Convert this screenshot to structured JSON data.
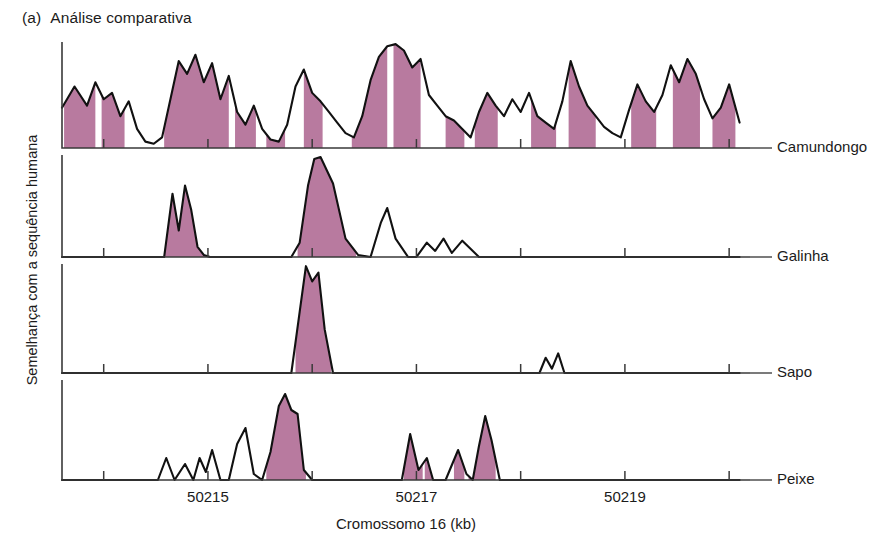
{
  "figure": {
    "tag": "(a)",
    "title": "Análise comparativa",
    "y_axis_label": "Semelhança com a sequência humana",
    "x_axis_label": "Cromossomo 16 (kb)"
  },
  "chart_data": {
    "type": "area",
    "title": "Análise comparativa",
    "xlabel": "Cromossomo 16 (kb)",
    "ylabel": "Semelhança com a sequência humana",
    "xlim": [
      50213.6,
      50220.2
    ],
    "ylim": [
      0,
      100
    ],
    "grid": false,
    "legend_position": "right-of-each-panel",
    "xticks": [
      50214,
      50215,
      50216,
      50217,
      50218,
      50219,
      50220
    ],
    "xtick_labels": [
      "",
      "50215",
      "",
      "50217",
      "",
      "50219",
      ""
    ],
    "fill_color": "#b87a9f",
    "line_color": "#111111",
    "fill_rule": "regions above conservation threshold are shaded",
    "panels": [
      {
        "name": "Camundongo",
        "order": 1,
        "description": "Conservação alta e contínua ao longo de toda a região, com numerosos picos amplos sombreados.",
        "x": [
          50213.6,
          50213.72,
          50213.84,
          50213.92,
          50214.0,
          50214.08,
          50214.16,
          50214.24,
          50214.32,
          50214.4,
          50214.48,
          50214.56,
          50214.64,
          50214.72,
          50214.8,
          50214.88,
          50214.96,
          50215.04,
          50215.12,
          50215.2,
          50215.28,
          50215.36,
          50215.44,
          50215.52,
          50215.6,
          50215.68,
          50215.76,
          50215.84,
          50215.92,
          50216.0,
          50216.08,
          50216.16,
          50216.24,
          50216.32,
          50216.4,
          50216.48,
          50216.56,
          50216.64,
          50216.72,
          50216.8,
          50216.88,
          50216.96,
          50217.04,
          50217.12,
          50217.2,
          50217.28,
          50217.36,
          50217.44,
          50217.52,
          50217.6,
          50217.68,
          50217.76,
          50217.84,
          50217.92,
          50218.0,
          50218.08,
          50218.16,
          50218.24,
          50218.32,
          50218.4,
          50218.48,
          50218.56,
          50218.64,
          50218.72,
          50218.8,
          50218.88,
          50218.96,
          50219.04,
          50219.12,
          50219.2,
          50219.28,
          50219.36,
          50219.44,
          50219.52,
          50219.6,
          50219.68,
          50219.76,
          50219.84,
          50219.92,
          50220.0,
          50220.1
        ],
        "y": [
          38,
          58,
          40,
          62,
          46,
          52,
          30,
          44,
          18,
          6,
          4,
          10,
          46,
          82,
          70,
          88,
          62,
          80,
          46,
          68,
          34,
          22,
          40,
          18,
          8,
          6,
          22,
          58,
          74,
          52,
          44,
          34,
          24,
          14,
          10,
          30,
          64,
          86,
          96,
          98,
          92,
          76,
          84,
          50,
          40,
          30,
          26,
          18,
          10,
          34,
          52,
          40,
          30,
          46,
          34,
          52,
          30,
          24,
          18,
          44,
          82,
          58,
          40,
          30,
          20,
          14,
          10,
          36,
          60,
          44,
          34,
          50,
          78,
          62,
          84,
          70,
          46,
          28,
          38,
          60,
          24
        ],
        "shaded_intervals": [
          [
            50213.62,
            50213.92
          ],
          [
            50213.98,
            50214.2
          ],
          [
            50214.58,
            50215.2
          ],
          [
            50215.26,
            50215.46
          ],
          [
            50215.56,
            50215.74
          ],
          [
            50215.92,
            50216.1
          ],
          [
            50216.38,
            50216.72
          ],
          [
            50216.78,
            50217.04
          ],
          [
            50217.28,
            50217.46
          ],
          [
            50217.56,
            50217.78
          ],
          [
            50218.1,
            50218.34
          ],
          [
            50218.46,
            50218.72
          ],
          [
            50219.06,
            50219.3
          ],
          [
            50219.46,
            50219.72
          ],
          [
            50219.84,
            50220.06
          ]
        ]
      },
      {
        "name": "Galinha",
        "order": 2,
        "description": "Conservação restrita: pico duplo próximo a 50215 e um pico grande e largo logo depois; poucos picos pequenos não sombreados.",
        "x": [
          50213.6,
          50214.1,
          50214.4,
          50214.58,
          50214.66,
          50214.72,
          50214.78,
          50214.84,
          50214.9,
          50214.96,
          50215.02,
          50215.2,
          50215.5,
          50215.8,
          50215.88,
          50215.96,
          50216.02,
          50216.08,
          50216.2,
          50216.32,
          50216.44,
          50216.56,
          50216.66,
          50216.72,
          50216.8,
          50216.92,
          50217.0,
          50217.1,
          50217.18,
          50217.26,
          50217.34,
          50217.44,
          50217.6,
          50218.0,
          50218.3,
          50218.6,
          50218.9,
          50219.2,
          50219.6,
          50220.1
        ],
        "y": [
          0,
          0,
          0,
          0,
          62,
          26,
          70,
          46,
          10,
          2,
          0,
          0,
          0,
          0,
          14,
          70,
          96,
          98,
          72,
          18,
          2,
          0,
          34,
          48,
          18,
          0,
          0,
          14,
          6,
          18,
          4,
          16,
          0,
          0,
          0,
          0,
          0,
          0,
          0,
          0
        ],
        "shaded_intervals": [
          [
            50214.58,
            50215.02
          ],
          [
            50215.86,
            50216.42
          ]
        ]
      },
      {
        "name": "Sapo",
        "order": 3,
        "description": "Um único pico estreito e alto, sombreado, logo após 50215; duas pequenas espículas não sombreadas perto de 50218,3.",
        "x": [
          50213.6,
          50214.5,
          50215.4,
          50215.8,
          50215.88,
          50215.94,
          50216.0,
          50216.06,
          50216.12,
          50216.2,
          50216.6,
          50217.4,
          50218.18,
          50218.24,
          50218.3,
          50218.36,
          50218.42,
          50218.6,
          50219.4,
          50220.1
        ],
        "y": [
          0,
          0,
          0,
          0,
          56,
          98,
          84,
          92,
          40,
          0,
          0,
          0,
          0,
          14,
          4,
          18,
          0,
          0,
          0,
          0
        ],
        "shaded_intervals": [
          [
            50215.84,
            50216.18
          ]
        ]
      },
      {
        "name": "Peixe",
        "order": 4,
        "description": "Picos pequenos não sombreados antes de 50215; um pico alto sombreado depois, e vários picos pequenos sombreados entre 50216,9 e 50217,6.",
        "x": [
          50213.6,
          50214.2,
          50214.52,
          50214.6,
          50214.68,
          50214.78,
          50214.86,
          50214.92,
          50214.98,
          50215.04,
          50215.12,
          50215.2,
          50215.28,
          50215.36,
          50215.44,
          50215.52,
          50215.6,
          50215.68,
          50215.74,
          50215.8,
          50215.86,
          50215.92,
          50216.0,
          50216.1,
          50216.5,
          50216.86,
          50216.94,
          50217.02,
          50217.1,
          50217.16,
          50217.22,
          50217.28,
          50217.4,
          50217.48,
          50217.54,
          50217.6,
          50217.66,
          50217.72,
          50217.8,
          50218.4,
          50219.2,
          50220.1
        ],
        "y": [
          0,
          0,
          0,
          22,
          0,
          16,
          0,
          22,
          8,
          30,
          0,
          0,
          36,
          52,
          6,
          0,
          28,
          74,
          86,
          70,
          66,
          10,
          0,
          0,
          0,
          0,
          46,
          10,
          22,
          0,
          0,
          0,
          30,
          6,
          0,
          34,
          64,
          40,
          0,
          0,
          0,
          0
        ],
        "shaded_intervals": [
          [
            50215.56,
            50215.94
          ],
          [
            50216.88,
            50217.06
          ],
          [
            50217.08,
            50217.16
          ],
          [
            50217.36,
            50217.46
          ],
          [
            50217.5,
            50217.76
          ]
        ]
      }
    ]
  }
}
